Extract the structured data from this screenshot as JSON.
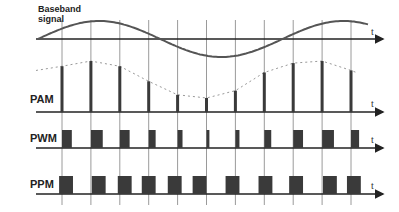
{
  "labels": {
    "baseband": "Baseband signal",
    "pam": "PAM",
    "pwm": "PWM",
    "ppm": "PPM",
    "time_axis": "t"
  },
  "colors": {
    "pulse": "#3a3a3a",
    "curve": "#555555",
    "grid": "#9a9a9a",
    "axis": "#222222",
    "envelope": "#999999"
  },
  "sampling": {
    "sample_count": 11,
    "signal_periods_shown": 1.35
  },
  "pam": {
    "amplitudes": [
      0.88,
      0.98,
      0.88,
      0.59,
      0.33,
      0.27,
      0.41,
      0.76,
      0.94,
      0.98,
      0.8
    ]
  },
  "pwm": {
    "widths": [
      0.34,
      0.41,
      0.34,
      0.24,
      0.17,
      0.1,
      0.14,
      0.24,
      0.34,
      0.41,
      0.28
    ]
  },
  "ppm": {
    "offsets": [
      -0.1,
      0.03,
      -0.07,
      -0.24,
      -0.34,
      -0.48,
      -0.34,
      -0.2,
      -0.14,
      0.03,
      -0.14
    ],
    "width": 0.48
  }
}
